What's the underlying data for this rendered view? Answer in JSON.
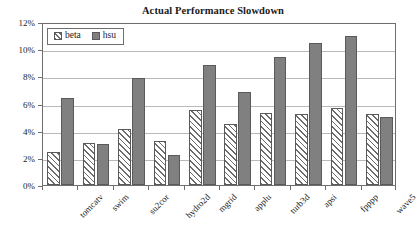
{
  "chart_data": {
    "type": "bar",
    "title": "Actual Performance Slowdown",
    "xlabel": "",
    "ylabel": "",
    "ylim": [
      0,
      12
    ],
    "ytick_values": [
      0,
      2,
      4,
      6,
      8,
      10,
      12
    ],
    "ytick_labels": [
      "0%",
      "2%",
      "4%",
      "6%",
      "8%",
      "10%",
      "12%"
    ],
    "grid": true,
    "legend_position": "top-left",
    "categories": [
      "tomcatv",
      "swim",
      "su2cor",
      "hydro2d",
      "mgrid",
      "applu",
      "turb3d",
      "apsi",
      "fpppp",
      "wave5"
    ],
    "series": [
      {
        "name": "beta",
        "color": "#ffffff",
        "pattern": "diagonal-hatch",
        "values": [
          2.4,
          3.1,
          4.1,
          3.25,
          5.55,
          4.5,
          5.3,
          5.2,
          5.7,
          5.2
        ]
      },
      {
        "name": "hsu",
        "color": "#808080",
        "pattern": "solid",
        "values": [
          6.4,
          3.0,
          7.85,
          2.2,
          8.8,
          6.85,
          9.45,
          10.45,
          10.95,
          5.0
        ]
      }
    ]
  },
  "legend": {
    "items": [
      {
        "label": "beta"
      },
      {
        "label": "hsu"
      }
    ]
  }
}
